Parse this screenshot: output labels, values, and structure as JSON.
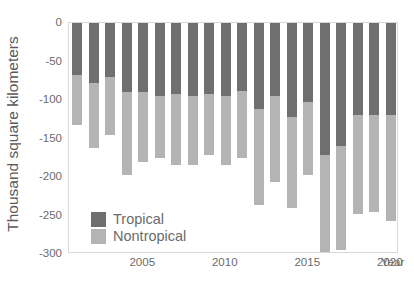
{
  "chart_data": {
    "type": "bar",
    "stacked": true,
    "title": "",
    "xlabel": "Year",
    "ylabel": "Thousand square kilometers",
    "ylim": [
      -300,
      0
    ],
    "yticks": [
      0,
      -50,
      -100,
      -150,
      -200,
      -250,
      -300
    ],
    "ytick_labels": [
      "0",
      "-50",
      "-100",
      "-150",
      "-200",
      "-250",
      "-300"
    ],
    "xlim": [
      2000.5,
      2020.5
    ],
    "xticks": [
      2005,
      2010,
      2015,
      2020
    ],
    "xtick_labels": [
      "2005",
      "2010",
      "2015",
      "2020"
    ],
    "grid": false,
    "legend_position": "lower-left",
    "categories": [
      2001,
      2002,
      2003,
      2004,
      2005,
      2006,
      2007,
      2008,
      2009,
      2010,
      2011,
      2012,
      2013,
      2014,
      2015,
      2016,
      2017,
      2018,
      2019,
      2020
    ],
    "series": [
      {
        "name": "Tropical",
        "color": "#6f6f6f",
        "values": [
          -68,
          -78,
          -70,
          -90,
          -90,
          -95,
          -92,
          -95,
          -92,
          -95,
          -88,
          -112,
          -95,
          -122,
          -103,
          -172,
          -160,
          -120,
          -120,
          -120
        ]
      },
      {
        "name": "Nontropical",
        "color": "#b4b4b4",
        "values": [
          -64,
          -85,
          -75,
          -107,
          -90,
          -80,
          -93,
          -90,
          -80,
          -90,
          -87,
          -125,
          -112,
          -118,
          -94,
          -125,
          -135,
          -128,
          -125,
          -137
        ]
      }
    ],
    "totals": [
      -132,
      -163,
      -145,
      -197,
      -180,
      -175,
      -185,
      -185,
      -172,
      -185,
      -175,
      -237,
      -207,
      -240,
      -197,
      -297,
      -295,
      -248,
      -245,
      -257
    ]
  },
  "legend": {
    "items": [
      {
        "label": "Tropical",
        "color": "#6f6f6f"
      },
      {
        "label": "Nontropical",
        "color": "#b4b4b4"
      }
    ]
  },
  "axes": {
    "y_title": "Thousand square kilometers",
    "x_title": "Year"
  }
}
